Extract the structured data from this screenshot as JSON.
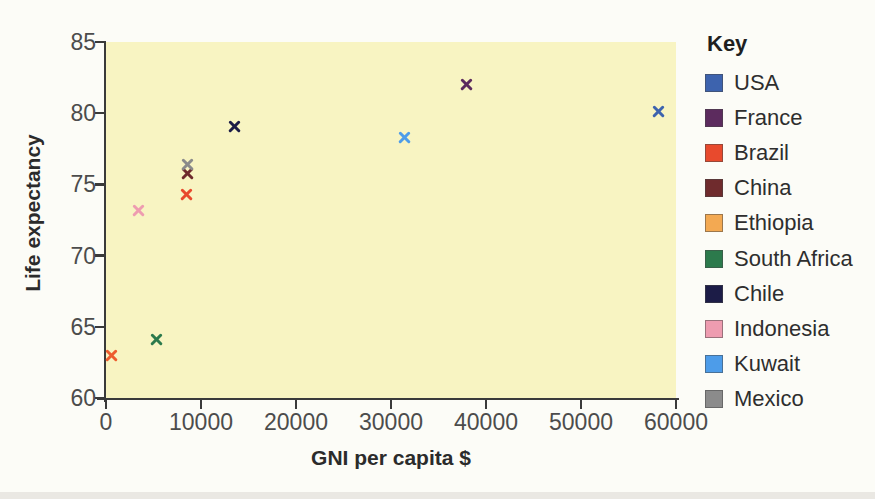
{
  "page": {
    "background": "#fcfcf7",
    "bottom_strip_color": "#eae8e3"
  },
  "chart_data": {
    "type": "scatter",
    "title": "",
    "xlabel": "GNI per capita $",
    "ylabel": "Life expectancy",
    "xlim": [
      0,
      60000
    ],
    "ylim": [
      60,
      85
    ],
    "xticks": [
      0,
      10000,
      20000,
      30000,
      40000,
      50000,
      60000
    ],
    "yticks": [
      60,
      65,
      70,
      75,
      80,
      85
    ],
    "grid": false,
    "marker": "x",
    "plot_background": "#f8f4c2",
    "axis_color": "#3a3a3a",
    "legend_title": "Key",
    "legend_position": "right",
    "series": [
      {
        "name": "USA",
        "color": "#3d63ae",
        "x": 58200,
        "y": 80.1
      },
      {
        "name": "France",
        "color": "#5c2b5e",
        "x": 37900,
        "y": 82.0
      },
      {
        "name": "Brazil",
        "color": "#e84a2d",
        "x": 8500,
        "y": 74.3
      },
      {
        "name": "China",
        "color": "#6f2b2d",
        "x": 8600,
        "y": 75.8
      },
      {
        "name": "Ethiopia",
        "color": "#f3a952",
        "marker_color": "#ed5c2e",
        "x": 600,
        "y": 63.0
      },
      {
        "name": "South Africa",
        "color": "#2c7a4c",
        "x": 5300,
        "y": 64.1
      },
      {
        "name": "Chile",
        "color": "#1c1c47",
        "x": 13500,
        "y": 79.1
      },
      {
        "name": "Indonesia",
        "color": "#ee9cb0",
        "x": 3450,
        "y": 73.2
      },
      {
        "name": "Kuwait",
        "color": "#4d9ce9",
        "x": 31400,
        "y": 78.3
      },
      {
        "name": "Mexico",
        "color": "#8b8b8b",
        "x": 8600,
        "y": 76.4
      }
    ]
  }
}
